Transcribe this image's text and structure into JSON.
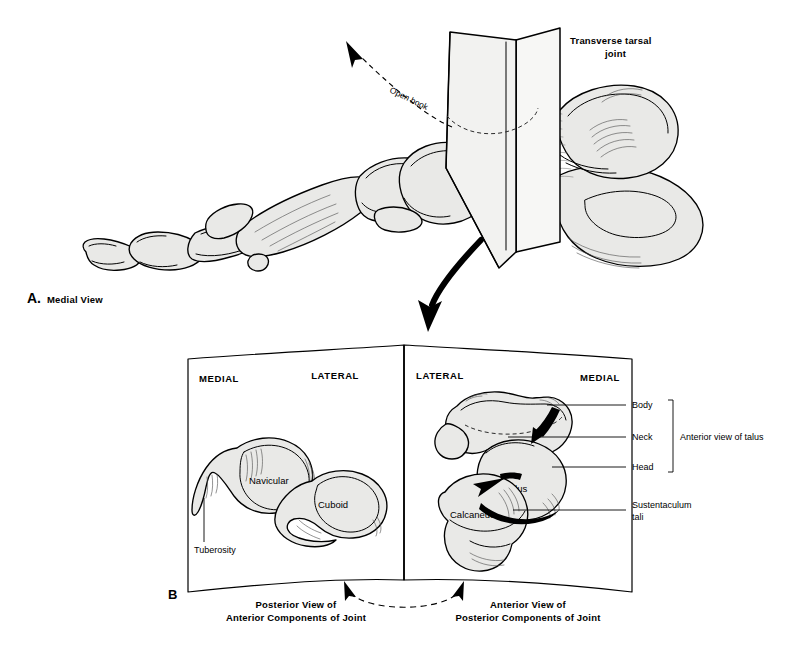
{
  "figure": {
    "panel_a": {
      "letter": "A.",
      "caption": "Medial View",
      "annotations": {
        "transverse_tarsal_joint": "Transverse tarsal\njoint",
        "transverse_tarsal_joint_line1": "Transverse tarsal",
        "transverse_tarsal_joint_line2": "joint",
        "open_book": "Open book"
      }
    },
    "panel_b": {
      "letter": "B",
      "left_page": {
        "orientation_left": "MEDIAL",
        "orientation_right": "LATERAL",
        "bones": [
          {
            "name": "Navicular"
          },
          {
            "name": "Cuboid"
          }
        ],
        "leaders": [
          {
            "label": "Tuberosity"
          }
        ],
        "caption_line1": "Posterior View of",
        "caption_line2": "Anterior Components of Joint"
      },
      "right_page": {
        "orientation_left": "LATERAL",
        "orientation_right": "MEDIAL",
        "bones": [
          {
            "name": "Talus"
          },
          {
            "name": "Calcaneus"
          }
        ],
        "leaders": [
          {
            "label": "Body"
          },
          {
            "label": "Neck"
          },
          {
            "label": "Head"
          },
          {
            "label": "Sustentaculum",
            "label2": "tali"
          }
        ],
        "bracket_label": "Anterior view of talus",
        "sustentaculum_line1": "Sustentaculum",
        "sustentaculum_line2": "tali",
        "caption_line1": "Anterior View of",
        "caption_line2": "Posterior Components of Joint"
      }
    },
    "colors": {
      "background": "#ffffff",
      "ink": "#000000",
      "bone_tint": "#e9e9e7",
      "plane_tint": "#f2f2f0"
    }
  }
}
